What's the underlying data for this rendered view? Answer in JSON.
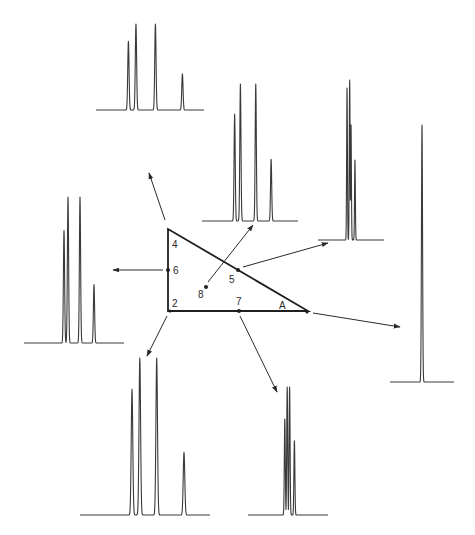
{
  "figure": {
    "colors": {
      "line": "#2a2a2a",
      "background": "#ffffff"
    }
  },
  "triangle": {
    "vertex_labels": [
      "4",
      "2",
      "A"
    ],
    "points": [
      {
        "id": "4",
        "label": "4",
        "role": "vertex-top"
      },
      {
        "id": "2",
        "label": "2",
        "role": "vertex-bottom-left"
      },
      {
        "id": "A",
        "label": "A",
        "role": "vertex-right"
      },
      {
        "id": "6",
        "label": "6",
        "role": "midpoint-left-edge"
      },
      {
        "id": "5",
        "label": "5",
        "role": "midpoint-hypotenuse"
      },
      {
        "id": "7",
        "label": "7",
        "role": "midpoint-bottom-edge"
      },
      {
        "id": "8",
        "label": "8",
        "role": "centroid"
      }
    ]
  },
  "chromatograms": [
    {
      "point": "4",
      "peaks": [
        {
          "rt": 0.3,
          "h": 0.8
        },
        {
          "rt": 0.37,
          "h": 1.0
        },
        {
          "rt": 0.55,
          "h": 1.0
        },
        {
          "rt": 0.8,
          "h": 0.42
        }
      ]
    },
    {
      "point": "8",
      "peaks": [
        {
          "rt": 0.34,
          "h": 0.78
        },
        {
          "rt": 0.4,
          "h": 1.0
        },
        {
          "rt": 0.56,
          "h": 1.0
        },
        {
          "rt": 0.72,
          "h": 0.45
        }
      ]
    },
    {
      "point": "5",
      "peaks": [
        {
          "rt": 0.44,
          "h": 0.95
        },
        {
          "rt": 0.48,
          "h": 1.0
        },
        {
          "rt": 0.5,
          "h": 0.72
        },
        {
          "rt": 0.56,
          "h": 0.5
        }
      ]
    },
    {
      "point": "A",
      "peaks": [
        {
          "rt": 0.5,
          "h": 1.0
        }
      ]
    },
    {
      "point": "6",
      "peaks": [
        {
          "rt": 0.4,
          "h": 0.77
        },
        {
          "rt": 0.44,
          "h": 1.0
        },
        {
          "rt": 0.56,
          "h": 1.0
        },
        {
          "rt": 0.7,
          "h": 0.4
        }
      ]
    },
    {
      "point": "2",
      "peaks": [
        {
          "rt": 0.4,
          "h": 0.8
        },
        {
          "rt": 0.46,
          "h": 1.0
        },
        {
          "rt": 0.59,
          "h": 1.0
        },
        {
          "rt": 0.8,
          "h": 0.4
        }
      ]
    },
    {
      "point": "7",
      "peaks": [
        {
          "rt": 0.46,
          "h": 0.75
        },
        {
          "rt": 0.49,
          "h": 1.0
        },
        {
          "rt": 0.52,
          "h": 1.0
        },
        {
          "rt": 0.58,
          "h": 0.58
        }
      ]
    }
  ]
}
